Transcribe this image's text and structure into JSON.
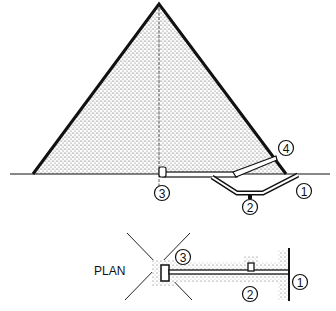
{
  "diagram": {
    "type": "pyramid cross-section with plan view",
    "section": {
      "markers": [
        {
          "id": "1",
          "label": "1"
        },
        {
          "id": "2",
          "label": "2"
        },
        {
          "id": "3",
          "label": "3"
        },
        {
          "id": "4",
          "label": "4"
        }
      ]
    },
    "plan": {
      "title": "PLAN",
      "markers": [
        {
          "id": "1",
          "label": "1"
        },
        {
          "id": "2",
          "label": "2"
        },
        {
          "id": "3",
          "label": "3"
        }
      ]
    },
    "colors": {
      "ink": "#111111",
      "stipple": "#555555",
      "background": "#ffffff"
    }
  }
}
